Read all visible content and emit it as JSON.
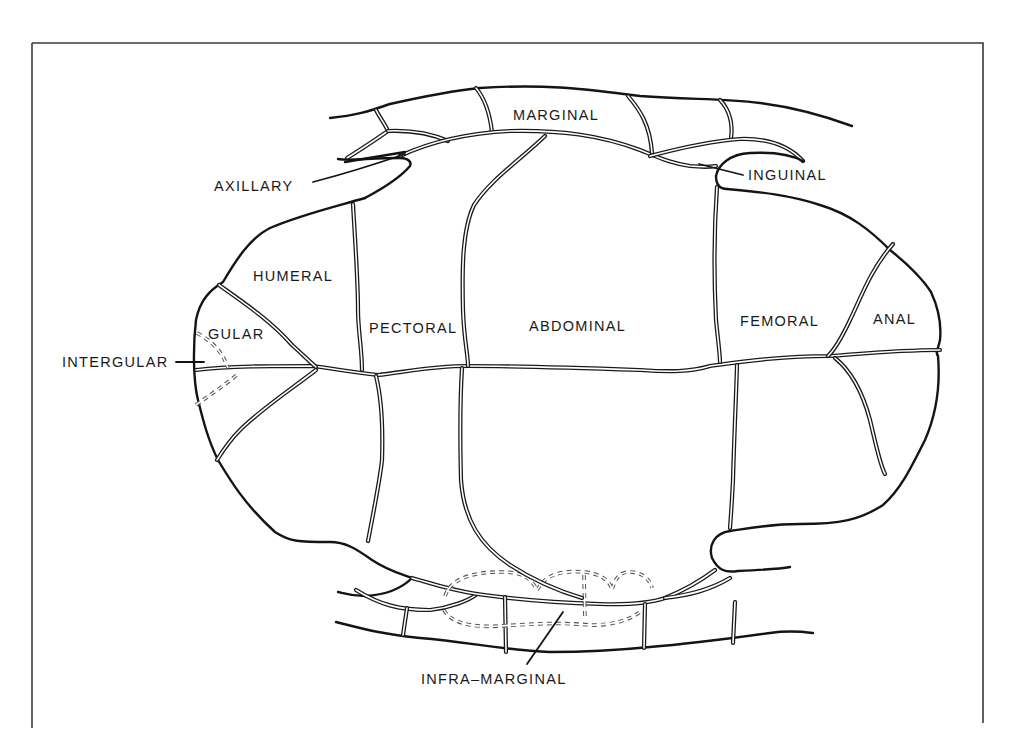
{
  "figure": {
    "colors": {
      "line": "#141414",
      "background": "#ffffff",
      "frame": "#3a3a3a"
    },
    "labels": {
      "marginal": "MARGINAL",
      "axillary": "AXILLARY",
      "inguinal": "INGUINAL",
      "humeral": "HUMERAL",
      "gular": "GULAR",
      "intergular": "INTERGULAR",
      "pectoral": "PECTORAL",
      "abdominal": "ABDOMINAL",
      "femoral": "FEMORAL",
      "anal": "ANAL",
      "infra_marginal": "INFRA–MARGINAL"
    }
  }
}
